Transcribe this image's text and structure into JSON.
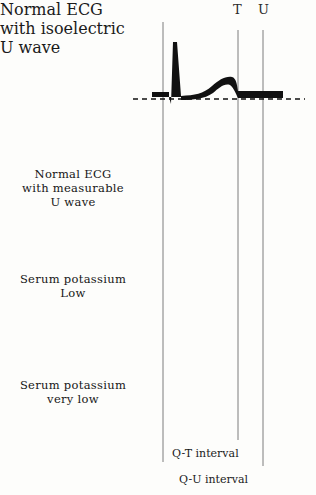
{
  "figure": {
    "title_markers": [
      {
        "name": "t-marker",
        "label": "T",
        "x": 238
      },
      {
        "name": "u-marker",
        "label": "U",
        "x": 263
      }
    ],
    "rows": [
      {
        "name": "normal-ecg-isoelectric-u",
        "label_lines": [
          "Normal ECG",
          "with isoelectric",
          "U wave"
        ],
        "baseline_y": 99,
        "description": "Normal ECG with isoelectric U wave",
        "t_wave": "upright rounded",
        "u_wave": "isoelectric (flat)"
      },
      {
        "name": "normal-ecg-measurable-u",
        "label_lines": [
          "Normal ECG",
          "with measurable",
          "U wave"
        ],
        "baseline_y": 199,
        "description": "Normal ECG with measurable U wave",
        "t_wave": "upright low",
        "u_wave": "small visible bump"
      },
      {
        "name": "serum-potassium-low",
        "label_lines": [
          "Serum potassium",
          "Low"
        ],
        "baseline_y": 299,
        "description": "Serum potassium Low",
        "t_wave": "flattened",
        "u_wave": "prominent equal to T"
      },
      {
        "name": "serum-potassium-very-low",
        "label_lines": [
          "Serum potassium",
          "very low"
        ],
        "baseline_y": 405,
        "description": "Serum potassium very low",
        "t_wave": "inverted / deeply negative",
        "u_wave": "tall prominent"
      }
    ],
    "vertical_lines": [
      {
        "name": "q-line",
        "x": 163
      },
      {
        "name": "t-line",
        "x": 238
      },
      {
        "name": "u-line",
        "x": 263
      }
    ],
    "intervals": [
      {
        "name": "qt-interval",
        "label": "Q-T interval",
        "x_start": 163,
        "x_end": 238,
        "arrow_y": 444,
        "text_y": 447
      },
      {
        "name": "qu-interval",
        "label": "Q-U interval",
        "x_start": 163,
        "x_end": 263,
        "arrow_y": 470,
        "text_y": 473
      }
    ],
    "colors": {
      "ink": "#111111",
      "line": "#6b6b6b",
      "background": "#fdfdfb"
    }
  }
}
